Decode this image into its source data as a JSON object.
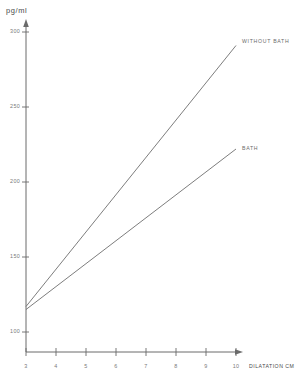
{
  "chart_data": {
    "type": "line",
    "title": "",
    "xlabel": "DILATATION CM",
    "ylabel": "pg/ml",
    "xlim": [
      3,
      10.2
    ],
    "ylim": [
      90,
      305
    ],
    "grid": false,
    "legend_position": "inline-right",
    "xticks": [
      "3",
      "4",
      "5",
      "6",
      "7",
      "8",
      "9",
      "10"
    ],
    "xtick_values": [
      3,
      4,
      5,
      6,
      7,
      8,
      9,
      10
    ],
    "yticks": [
      "100",
      "150",
      "200",
      "250",
      "300"
    ],
    "ytick_values": [
      100,
      150,
      200,
      250,
      300
    ],
    "x": [
      3,
      10
    ],
    "series": [
      {
        "name": "WITHOUT BATH",
        "values": [
          117,
          291
        ],
        "color": "#6e6e6e",
        "label_x": 10.1,
        "label_y": 293
      },
      {
        "name": "BATH",
        "values": [
          115,
          222
        ],
        "color": "#6e6e6e",
        "label_x": 10.1,
        "label_y": 225
      }
    ],
    "axis_color": "#6a6a6a"
  }
}
